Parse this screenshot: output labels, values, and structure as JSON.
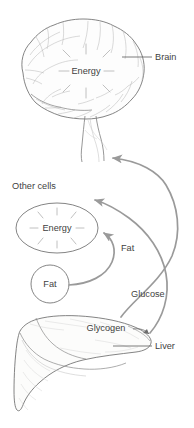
{
  "figure": {
    "background_color": "#ffffff",
    "ink_color": "#6e6e6e",
    "text_color": "#4a4a4a",
    "arrow_color": "#9a9a9a",
    "width": 194,
    "height": 428
  },
  "labels": {
    "brain": "Brain",
    "brain_energy": "Energy",
    "other_cells": "Other cells",
    "other_cells_energy": "Energy",
    "fat_store": "Fat",
    "fat_flow": "Fat",
    "glucose_flow": "Glucose",
    "glycogen": "Glycogen",
    "liver": "Liver"
  },
  "organs": [
    {
      "name": "brain",
      "label": "Brain",
      "inner_label": "Energy",
      "leader_line": true
    },
    {
      "name": "other-cells",
      "label": "Other cells",
      "inner_label": "Energy",
      "leader_line": false
    },
    {
      "name": "fat-store",
      "label": "Fat",
      "inner_label": "Fat",
      "leader_line": false
    },
    {
      "name": "liver",
      "label": "Liver",
      "inner_label": "Glycogen",
      "leader_line": true
    }
  ],
  "flows": [
    {
      "name": "glucose-to-brain",
      "label": "Glucose",
      "from": "liver",
      "to": "brain"
    },
    {
      "name": "glucose-to-other-cells",
      "label": "Glucose",
      "from": "liver",
      "to": "other-cells"
    },
    {
      "name": "fat-to-other-cells",
      "label": "Fat",
      "from": "fat-store",
      "to": "other-cells"
    }
  ]
}
